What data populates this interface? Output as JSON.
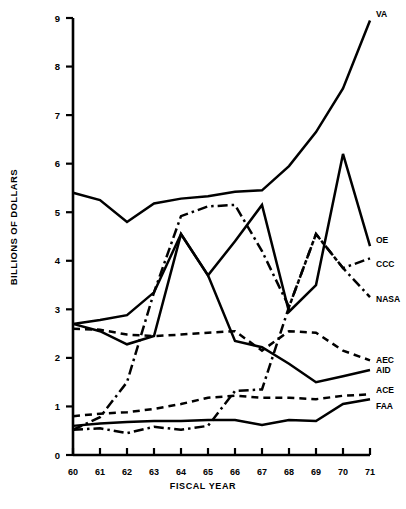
{
  "chart_data": {
    "type": "line",
    "title": "",
    "xlabel": "FISCAL YEAR",
    "ylabel": "BILLIONS OF DOLLARS",
    "x": [
      60,
      61,
      62,
      63,
      64,
      65,
      66,
      67,
      68,
      69,
      70,
      71
    ],
    "xtick_labels": [
      "60",
      "61",
      "62",
      "63",
      "64",
      "65",
      "66",
      "67",
      "68",
      "69",
      "70",
      "71"
    ],
    "ytick_labels": [
      "0",
      "1",
      "2",
      "3",
      "4",
      "5",
      "6",
      "7",
      "8",
      "9"
    ],
    "xlim": [
      60,
      71
    ],
    "ylim": [
      0,
      9
    ],
    "grid": false,
    "legend": "right-inline-labels",
    "series": [
      {
        "name": "VA",
        "label": "VA",
        "style": "solid",
        "values": [
          5.4,
          5.25,
          4.8,
          5.18,
          5.28,
          5.33,
          5.42,
          5.45,
          5.95,
          6.65,
          7.55,
          8.95
        ]
      },
      {
        "name": "OE",
        "label": "OE",
        "style": "solid",
        "values": [
          2.7,
          2.55,
          2.28,
          2.45,
          4.55,
          3.7,
          4.4,
          5.15,
          2.95,
          3.5,
          6.2,
          4.3
        ]
      },
      {
        "name": "CCC",
        "label": "CCC",
        "style": "dash-dot",
        "values": [
          0.52,
          0.78,
          1.5,
          3.35,
          4.92,
          5.12,
          5.15,
          4.2,
          3.05,
          4.55,
          3.85,
          4.05
        ]
      },
      {
        "name": "NASA",
        "label": "NASA",
        "style": "dash-dot",
        "values": [
          0.52,
          0.55,
          0.45,
          0.58,
          0.52,
          0.6,
          1.32,
          1.35,
          3.05,
          4.55,
          3.85,
          3.25
        ]
      },
      {
        "name": "AEC",
        "label": "AEC",
        "style": "dashed",
        "values": [
          2.6,
          2.58,
          2.48,
          2.45,
          2.48,
          2.52,
          2.55,
          2.15,
          2.55,
          2.52,
          2.15,
          1.95
        ]
      },
      {
        "name": "AID",
        "label": "AID",
        "style": "solid",
        "values": [
          2.7,
          2.78,
          2.88,
          3.35,
          4.55,
          3.7,
          2.35,
          2.22,
          1.88,
          1.5,
          1.62,
          1.75
        ]
      },
      {
        "name": "ACE",
        "label": "ACE",
        "style": "dashed",
        "values": [
          0.8,
          0.85,
          0.88,
          0.95,
          1.05,
          1.18,
          1.22,
          1.18,
          1.18,
          1.15,
          1.22,
          1.25
        ]
      },
      {
        "name": "FAA",
        "label": "FAA",
        "style": "solid",
        "values": [
          0.6,
          0.65,
          0.68,
          0.7,
          0.7,
          0.72,
          0.72,
          0.62,
          0.72,
          0.7,
          1.05,
          1.15
        ]
      }
    ],
    "colors": {
      "line": "#000000",
      "axis": "#000000",
      "background": "#ffffff"
    }
  }
}
